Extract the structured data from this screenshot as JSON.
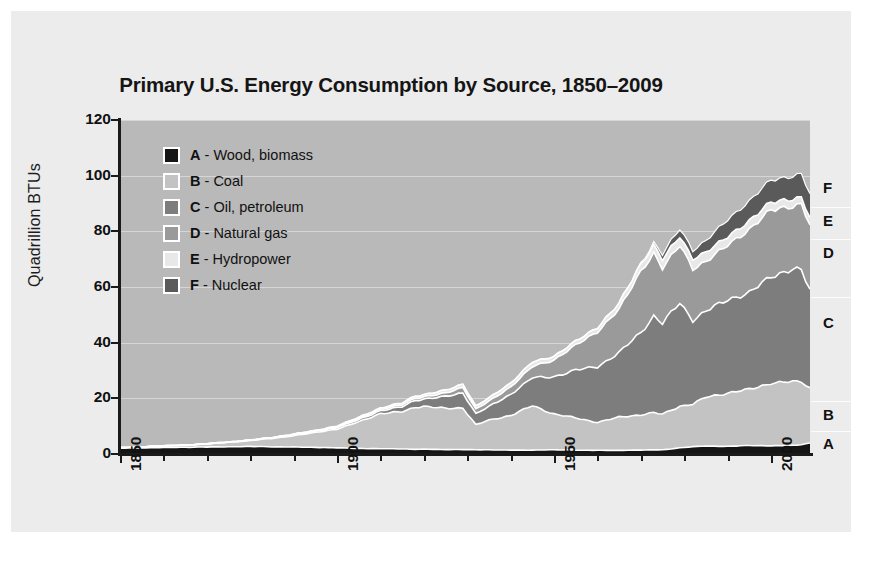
{
  "figure": {
    "title": "Primary U.S. Energy Consumption by Source, 1850–2009",
    "ylabel": "Quadrillion BTUs",
    "source": "SOURCES: ENERGY INFORMATION ADMINISTRATION, U.S. DEPARTMENT OF ENERGY",
    "background": "#ececec",
    "plot_background": "#b9b9b9"
  },
  "legend": {
    "items": [
      {
        "key": "A",
        "sep": " - ",
        "label": "Wood, biomass",
        "color": "#151515"
      },
      {
        "key": "B",
        "sep": " - ",
        "label": "Coal",
        "color": "#c3c3c3"
      },
      {
        "key": "C",
        "sep": " - ",
        "label": "Oil, petroleum",
        "color": "#7d7d7d"
      },
      {
        "key": "D",
        "sep": " - ",
        "label": "Natural gas",
        "color": "#9a9a9a"
      },
      {
        "key": "E",
        "sep": " - ",
        "label": "Hydropower",
        "color": "#e8e8e8"
      },
      {
        "key": "F",
        "sep": " - ",
        "label": "Nuclear",
        "color": "#5a5a5a"
      }
    ]
  },
  "band_labels": [
    {
      "key": "F",
      "y": 177
    },
    {
      "key": "E",
      "y": 210
    },
    {
      "key": "D",
      "y": 242
    },
    {
      "key": "C",
      "y": 312
    },
    {
      "key": "B",
      "y": 404
    },
    {
      "key": "A",
      "y": 433
    }
  ],
  "axes": {
    "y_ticks": [
      "0",
      "20",
      "40",
      "60",
      "80",
      "100",
      "120"
    ],
    "x_ticks": [
      "1850",
      "1900",
      "1950",
      "2000"
    ]
  },
  "chart_data": {
    "type": "area",
    "stacked": true,
    "title": "Primary U.S. Energy Consumption by Source, 1850–2009",
    "xlabel": "",
    "ylabel": "Quadrillion BTUs",
    "xlim": [
      1850,
      2009
    ],
    "ylim": [
      0,
      120
    ],
    "y_ticks": [
      0,
      20,
      40,
      60,
      80,
      100,
      120
    ],
    "x_ticks": [
      1850,
      1900,
      1950,
      2000
    ],
    "grid": "horizontal",
    "legend_position": "inside-top-left",
    "x": [
      1850,
      1855,
      1860,
      1865,
      1870,
      1875,
      1880,
      1885,
      1890,
      1895,
      1900,
      1905,
      1910,
      1915,
      1918,
      1920,
      1925,
      1929,
      1932,
      1935,
      1940,
      1945,
      1950,
      1955,
      1960,
      1965,
      1970,
      1973,
      1975,
      1979,
      1982,
      1985,
      1990,
      1995,
      2000,
      2005,
      2007,
      2009
    ],
    "series": [
      {
        "name": "Wood, biomass",
        "key": "A",
        "color": "#151515",
        "values": [
          2.1,
          2.2,
          2.3,
          2.4,
          2.5,
          2.6,
          2.7,
          2.6,
          2.5,
          2.4,
          2.2,
          2.0,
          1.9,
          1.8,
          1.7,
          1.7,
          1.6,
          1.6,
          1.5,
          1.5,
          1.4,
          1.4,
          1.5,
          1.4,
          1.3,
          1.3,
          1.4,
          1.5,
          1.5,
          2.2,
          2.6,
          2.9,
          2.7,
          3.1,
          2.9,
          3.1,
          3.4,
          3.9
        ]
      },
      {
        "name": "Coal",
        "key": "B",
        "color": "#c3c3c3",
        "values": [
          0.2,
          0.4,
          0.6,
          0.8,
          1.1,
          1.6,
          2.1,
          3.0,
          4.1,
          5.3,
          6.8,
          9.5,
          12.7,
          13.3,
          15.1,
          15.5,
          14.7,
          15.0,
          9.0,
          10.6,
          12.5,
          15.9,
          12.9,
          11.5,
          10.1,
          11.9,
          12.7,
          13.3,
          12.8,
          15.0,
          15.3,
          17.5,
          19.2,
          20.1,
          22.6,
          22.8,
          22.7,
          19.8
        ]
      },
      {
        "name": "Oil, petroleum",
        "key": "C",
        "color": "#7d7d7d",
        "values": [
          0.0,
          0.0,
          0.0,
          0.0,
          0.1,
          0.1,
          0.2,
          0.2,
          0.3,
          0.4,
          0.5,
          0.8,
          1.0,
          1.8,
          2.5,
          2.6,
          4.3,
          5.4,
          4.0,
          4.9,
          7.5,
          10.1,
          13.3,
          17.3,
          19.9,
          23.2,
          29.5,
          34.8,
          32.7,
          37.1,
          30.2,
          30.9,
          33.6,
          34.6,
          38.4,
          40.4,
          39.8,
          35.3
        ]
      },
      {
        "name": "Natural gas",
        "key": "D",
        "color": "#9a9a9a",
        "values": [
          0.0,
          0.0,
          0.0,
          0.0,
          0.0,
          0.0,
          0.0,
          0.1,
          0.2,
          0.2,
          0.3,
          0.4,
          0.5,
          0.7,
          0.8,
          0.8,
          1.2,
          2.0,
          1.6,
          1.9,
          2.7,
          4.0,
          6.0,
          9.0,
          12.4,
          15.8,
          21.8,
          22.5,
          19.9,
          20.7,
          18.4,
          17.8,
          19.6,
          22.7,
          23.9,
          22.6,
          23.6,
          23.4
        ]
      },
      {
        "name": "Hydropower",
        "key": "E",
        "color": "#e8e8e8",
        "values": [
          0.0,
          0.0,
          0.0,
          0.0,
          0.0,
          0.0,
          0.0,
          0.0,
          0.1,
          0.1,
          0.3,
          0.4,
          0.5,
          0.7,
          0.8,
          0.8,
          1.0,
          1.2,
          1.1,
          1.2,
          1.4,
          1.6,
          1.4,
          1.4,
          1.6,
          2.1,
          2.6,
          2.9,
          3.2,
          3.1,
          3.6,
          3.4,
          3.0,
          3.2,
          2.8,
          2.7,
          2.4,
          2.7
        ]
      },
      {
        "name": "Nuclear",
        "key": "F",
        "color": "#5a5a5a",
        "values": [
          0.0,
          0.0,
          0.0,
          0.0,
          0.0,
          0.0,
          0.0,
          0.0,
          0.0,
          0.0,
          0.0,
          0.0,
          0.0,
          0.0,
          0.0,
          0.0,
          0.0,
          0.0,
          0.0,
          0.0,
          0.0,
          0.0,
          0.0,
          0.0,
          0.0,
          0.0,
          0.2,
          0.9,
          1.9,
          2.8,
          3.1,
          4.1,
          6.1,
          7.1,
          7.9,
          8.2,
          8.5,
          8.4
        ]
      }
    ]
  }
}
